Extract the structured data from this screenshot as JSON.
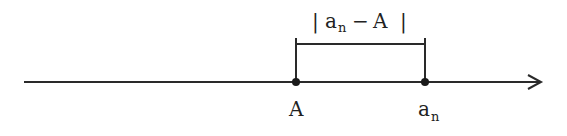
{
  "diagram": {
    "type": "number-line",
    "colors": {
      "line": "#2a2a2a",
      "text": "#222222",
      "background": "#ffffff"
    },
    "points": [
      {
        "id": "A",
        "label": "A",
        "subscript": ""
      },
      {
        "id": "a_n",
        "label": "a",
        "subscript": "n"
      }
    ],
    "bracket_label": {
      "open": "|",
      "var": "a",
      "sub": "n",
      "op": "−",
      "rhs": "A",
      "close": "|"
    }
  }
}
